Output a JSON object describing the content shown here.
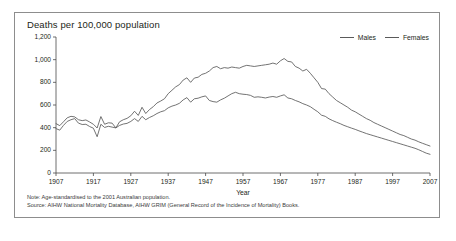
{
  "figure": {
    "title": "Deaths per 100,000 population",
    "note": "Note: Age-standardised to the 2001 Australian population.",
    "source": "Source: AIHW National Mortality Database, AIHW GRIM (General Record of the Incidence of Mortality) Books."
  },
  "chart_data": {
    "type": "line",
    "title": "Deaths per 100,000 population",
    "xlabel": "Year",
    "ylabel": "",
    "xlim": [
      1907,
      2007
    ],
    "ylim": [
      0,
      1200
    ],
    "grid": false,
    "legend_position": "top-right",
    "xticks": [
      "1907",
      "1917",
      "1927",
      "1937",
      "1947",
      "1957",
      "1967",
      "1977",
      "1987",
      "1997",
      "2007"
    ],
    "yticks": [
      "0",
      "200",
      "400",
      "600",
      "800",
      "1,000",
      "1,200"
    ],
    "line_color": "#5a5a5a",
    "series": [
      {
        "name": "Males",
        "color": "#5a5a5a",
        "x": [
          1907,
          1908,
          1909,
          1910,
          1911,
          1912,
          1913,
          1914,
          1915,
          1916,
          1917,
          1918,
          1919,
          1920,
          1921,
          1922,
          1923,
          1924,
          1925,
          1926,
          1927,
          1928,
          1929,
          1930,
          1931,
          1932,
          1933,
          1934,
          1935,
          1936,
          1937,
          1938,
          1939,
          1940,
          1941,
          1942,
          1943,
          1944,
          1945,
          1946,
          1947,
          1948,
          1949,
          1950,
          1951,
          1952,
          1953,
          1954,
          1955,
          1956,
          1957,
          1958,
          1959,
          1960,
          1961,
          1962,
          1963,
          1964,
          1965,
          1966,
          1967,
          1968,
          1969,
          1970,
          1971,
          1972,
          1973,
          1974,
          1975,
          1976,
          1977,
          1978,
          1979,
          1980,
          1981,
          1982,
          1983,
          1984,
          1985,
          1986,
          1987,
          1988,
          1989,
          1990,
          1991,
          1992,
          1993,
          1994,
          1995,
          1996,
          1997,
          1998,
          1999,
          2000,
          2001,
          2002,
          2003,
          2004,
          2005,
          2006,
          2007
        ],
        "values": [
          436,
          418,
          452,
          487,
          500,
          495,
          470,
          462,
          468,
          450,
          430,
          397,
          498,
          430,
          443,
          440,
          398,
          452,
          470,
          482,
          505,
          545,
          508,
          580,
          525,
          560,
          585,
          618,
          635,
          655,
          700,
          730,
          760,
          780,
          820,
          840,
          800,
          838,
          845,
          870,
          880,
          900,
          930,
          940,
          920,
          930,
          925,
          935,
          930,
          925,
          940,
          950,
          945,
          940,
          945,
          950,
          955,
          960,
          970,
          960,
          990,
          1010,
          985,
          980,
          940,
          925,
          900,
          915,
          880,
          840,
          800,
          745,
          740,
          700,
          670,
          640,
          620,
          600,
          580,
          555,
          540,
          520,
          500,
          480,
          465,
          445,
          430,
          415,
          400,
          385,
          370,
          355,
          340,
          330,
          315,
          300,
          290,
          275,
          262,
          250,
          238
        ]
      },
      {
        "name": "Females",
        "color": "#5a5a5a",
        "x": [
          1907,
          1908,
          1909,
          1910,
          1911,
          1912,
          1913,
          1914,
          1915,
          1916,
          1917,
          1918,
          1919,
          1920,
          1921,
          1922,
          1923,
          1924,
          1925,
          1926,
          1927,
          1928,
          1929,
          1930,
          1931,
          1932,
          1933,
          1934,
          1935,
          1936,
          1937,
          1938,
          1939,
          1940,
          1941,
          1942,
          1943,
          1944,
          1945,
          1946,
          1947,
          1948,
          1949,
          1950,
          1951,
          1952,
          1953,
          1954,
          1955,
          1956,
          1957,
          1958,
          1959,
          1960,
          1961,
          1962,
          1963,
          1964,
          1965,
          1966,
          1967,
          1968,
          1969,
          1970,
          1971,
          1972,
          1973,
          1974,
          1975,
          1976,
          1977,
          1978,
          1979,
          1980,
          1981,
          1982,
          1983,
          1984,
          1985,
          1986,
          1987,
          1988,
          1989,
          1990,
          1991,
          1992,
          1993,
          1994,
          1995,
          1996,
          1997,
          1998,
          1999,
          2000,
          2001,
          2002,
          2003,
          2004,
          2005,
          2006,
          2007
        ],
        "values": [
          392,
          378,
          420,
          455,
          470,
          480,
          440,
          428,
          430,
          410,
          395,
          320,
          430,
          402,
          412,
          405,
          398,
          420,
          432,
          438,
          455,
          480,
          455,
          500,
          470,
          490,
          505,
          525,
          540,
          550,
          575,
          590,
          600,
          615,
          645,
          665,
          625,
          655,
          660,
          672,
          680,
          640,
          630,
          625,
          645,
          660,
          680,
          700,
          712,
          700,
          695,
          692,
          685,
          668,
          672,
          668,
          662,
          670,
          675,
          668,
          680,
          690,
          662,
          655,
          640,
          628,
          612,
          600,
          585,
          562,
          540,
          510,
          500,
          478,
          462,
          448,
          435,
          420,
          408,
          396,
          385,
          372,
          360,
          348,
          338,
          328,
          318,
          308,
          298,
          288,
          278,
          268,
          258,
          248,
          238,
          228,
          218,
          205,
          190,
          175,
          165
        ]
      }
    ]
  }
}
